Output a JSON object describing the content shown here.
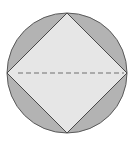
{
  "diagram": {
    "circle": {
      "cx": 67,
      "cy": 73,
      "r": 60,
      "fill": "#b3b3b3",
      "stroke": "#5a5a5a"
    },
    "square": {
      "points": "67,13 127,73 67,133 7,73",
      "fill": "#e6e6e6",
      "stroke": "#4a4a4a"
    },
    "diagonal": {
      "x1": 18,
      "y1": 73,
      "x2": 124,
      "y2": 73,
      "stroke": "#6e6e6e",
      "dash": "5,3"
    }
  }
}
